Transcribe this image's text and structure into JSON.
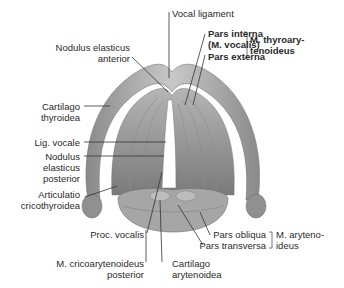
{
  "diagram": {
    "labels": {
      "vocal_ligament": "Vocal ligament",
      "nodulus_anterior_1": "Nodulus elasticus",
      "nodulus_anterior_2": "anterior",
      "pars_interna_1": "Pars interna",
      "pars_interna_2": "(M. vocalis)",
      "pars_externa": "Pars externa",
      "thyroarytenoideus_1": "M. thyroary-",
      "thyroarytenoideus_2": "tenoideus",
      "cartilago_thyroidea_1": "Cartilago",
      "cartilago_thyroidea_2": "thyroidea",
      "lig_vocale": "Lig. vocale",
      "nodulus_posterior_1": "Nodulus",
      "nodulus_posterior_2": "elasticus",
      "nodulus_posterior_3": "posterior",
      "articulatio_1": "Articulatio",
      "articulatio_2": "cricothyroidea",
      "proc_vocalis": "Proc. vocalis",
      "cricoarytenoideus_1": "M. cricoarytenoideus",
      "cricoarytenoideus_2": "posterior",
      "cartilago_arytenoidea_1": "Cartilago",
      "cartilago_arytenoidea_2": "arytenoidea",
      "pars_obliqua": "Pars obliqua",
      "pars_transversa": "Pars transversa",
      "arytenoideus_1": "M. aryteno-",
      "arytenoideus_2": "ideus"
    },
    "colors": {
      "tissue": "#9a9a9a",
      "tissue_light": "#c4c4c4",
      "tissue_dark": "#6e6e6e",
      "leader_line": "#333333"
    }
  }
}
